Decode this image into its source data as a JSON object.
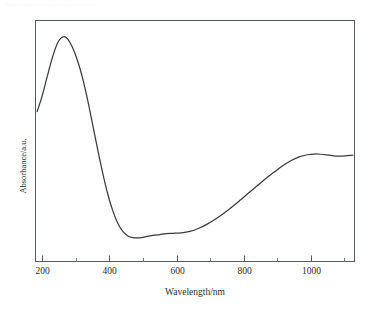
{
  "page": {
    "top_artifact_text": "— —— ——— —— ————"
  },
  "chart_data": {
    "type": "line",
    "title": "",
    "subtitle": "",
    "xlabel": "Wavelength/nm",
    "ylabel": "Absorbance/a.u.",
    "xlim": [
      180,
      1130
    ],
    "ylim": [
      0,
      1
    ],
    "grid": false,
    "legend": null,
    "legend_position": "none",
    "x_ticks_major": [
      200,
      400,
      600,
      800,
      1000
    ],
    "x_tick_labels": [
      "200",
      "400",
      "600",
      "800",
      "1000"
    ],
    "x_ticks_minor": [
      300,
      500,
      700,
      900,
      1100
    ],
    "y_ticks_major": [],
    "y_tick_labels": [],
    "series": [
      {
        "name": "absorbance",
        "color": "#3a3a3a",
        "x": [
          185,
          200,
          215,
          230,
          245,
          255,
          265,
          275,
          290,
          305,
          320,
          335,
          350,
          365,
          380,
          395,
          410,
          425,
          440,
          455,
          470,
          490,
          510,
          530,
          550,
          570,
          590,
          615,
          640,
          665,
          690,
          715,
          740,
          765,
          790,
          815,
          840,
          865,
          890,
          915,
          940,
          965,
          990,
          1010,
          1030,
          1055,
          1080,
          1100,
          1125
        ],
        "y": [
          0.622,
          0.688,
          0.768,
          0.845,
          0.905,
          0.926,
          0.933,
          0.925,
          0.889,
          0.834,
          0.762,
          0.672,
          0.57,
          0.466,
          0.368,
          0.281,
          0.211,
          0.159,
          0.125,
          0.106,
          0.099,
          0.098,
          0.103,
          0.108,
          0.112,
          0.116,
          0.117,
          0.119,
          0.125,
          0.137,
          0.154,
          0.175,
          0.199,
          0.226,
          0.255,
          0.285,
          0.314,
          0.343,
          0.37,
          0.396,
          0.418,
          0.434,
          0.443,
          0.446,
          0.445,
          0.441,
          0.437,
          0.438,
          0.441
        ]
      }
    ],
    "annotations": {
      "peak_wavelength_nm": 265,
      "peak_absorbance": 0.933,
      "trough_wavelength_nm": 470,
      "trough_absorbance": 0.099,
      "plateau_wavelength_nm": 1010,
      "plateau_absorbance": 0.446
    }
  }
}
